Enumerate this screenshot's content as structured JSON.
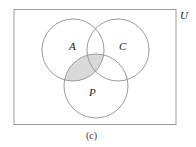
{
  "diagram": {
    "type": "venn",
    "universe_label": "U",
    "sets": [
      {
        "name": "A",
        "label": "A"
      },
      {
        "name": "C",
        "label": "C"
      },
      {
        "name": "P",
        "label": "P"
      }
    ],
    "shaded_region": "A ∩ P",
    "caption": "(c)",
    "colors": {
      "outline": "#9a9a9a",
      "shade": "#d9d9d9"
    }
  }
}
